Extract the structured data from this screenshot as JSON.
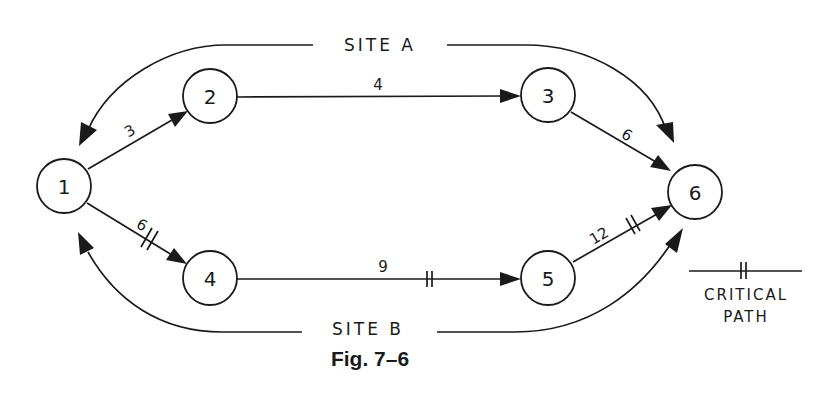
{
  "figure": {
    "caption": "Fig. 7–6",
    "ink_color": "#1a1a1a",
    "background": "#ffffff"
  },
  "nodes": [
    {
      "id": "1",
      "label": "1"
    },
    {
      "id": "2",
      "label": "2"
    },
    {
      "id": "3",
      "label": "3"
    },
    {
      "id": "4",
      "label": "4"
    },
    {
      "id": "5",
      "label": "5"
    },
    {
      "id": "6",
      "label": "6"
    }
  ],
  "edges": [
    {
      "from": "1",
      "to": "2",
      "duration": "3",
      "critical": false
    },
    {
      "from": "2",
      "to": "3",
      "duration": "4",
      "critical": false
    },
    {
      "from": "3",
      "to": "6",
      "duration": "6",
      "critical": false
    },
    {
      "from": "1",
      "to": "4",
      "duration": "6",
      "critical": true
    },
    {
      "from": "4",
      "to": "5",
      "duration": "9",
      "critical": true
    },
    {
      "from": "5",
      "to": "6",
      "duration": "12",
      "critical": true
    }
  ],
  "sites": {
    "top": "SITE A",
    "bottom": "SITE B"
  },
  "legend": {
    "line1": "CRITICAL",
    "line2": "PATH"
  }
}
